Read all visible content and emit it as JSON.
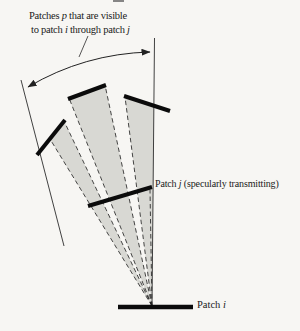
{
  "figure": {
    "title_domain": "radiosity-specular-transmission-diagram",
    "background": "#f7f6f3",
    "ink": "#1a1a1a",
    "shade": "#d8d8d3",
    "caption": {
      "line1": [
        {
          "t": "Patches "
        },
        {
          "t": "p",
          "i": true
        },
        {
          "t": " that are visible"
        }
      ],
      "line2": [
        {
          "t": "to patch "
        },
        {
          "t": "i",
          "i": true
        },
        {
          "t": " through patch "
        },
        {
          "t": "j",
          "i": true
        }
      ]
    },
    "labels": {
      "patch_j": [
        {
          "t": "Patch "
        },
        {
          "t": "j",
          "i": true
        },
        {
          "t": " (specularly transmitting)"
        }
      ],
      "patch_i": [
        {
          "t": "Patch "
        },
        {
          "t": "i",
          "i": true
        }
      ]
    },
    "shapes": [
      {
        "name": "beam-wedge-left",
        "tag": "polygon",
        "attrs": {
          "points": "152,306 50,139 64,121",
          "fill": "#d8d8d3"
        }
      },
      {
        "name": "beam-wedge-middle",
        "tag": "polygon",
        "attrs": {
          "points": "152,306 69,98 105,85",
          "fill": "#d8d8d3"
        }
      },
      {
        "name": "beam-wedge-right",
        "tag": "polygon",
        "attrs": {
          "points": "152,306 125,97 154,105",
          "fill": "#d8d8d3"
        }
      },
      {
        "name": "dashed-ray-1",
        "tag": "line",
        "attrs": {
          "x1": "152",
          "y1": "306",
          "x2": "50",
          "y2": "139",
          "stroke": "#1a1a1a",
          "stroke-width": "0.8",
          "stroke-dasharray": "4.5 3"
        }
      },
      {
        "name": "dashed-ray-2",
        "tag": "line",
        "attrs": {
          "x1": "152",
          "y1": "306",
          "x2": "64",
          "y2": "121",
          "stroke": "#1a1a1a",
          "stroke-width": "0.8",
          "stroke-dasharray": "4.5 3"
        }
      },
      {
        "name": "dashed-ray-3",
        "tag": "line",
        "attrs": {
          "x1": "152",
          "y1": "306",
          "x2": "69",
          "y2": "98",
          "stroke": "#1a1a1a",
          "stroke-width": "0.8",
          "stroke-dasharray": "4.5 3"
        }
      },
      {
        "name": "dashed-ray-4",
        "tag": "line",
        "attrs": {
          "x1": "152",
          "y1": "306",
          "x2": "105",
          "y2": "85",
          "stroke": "#1a1a1a",
          "stroke-width": "0.8",
          "stroke-dasharray": "4.5 3"
        }
      },
      {
        "name": "dashed-ray-5",
        "tag": "line",
        "attrs": {
          "x1": "152",
          "y1": "306",
          "x2": "125",
          "y2": "97",
          "stroke": "#1a1a1a",
          "stroke-width": "0.8",
          "stroke-dasharray": "4.5 3"
        }
      },
      {
        "name": "dashed-ray-6",
        "tag": "line",
        "attrs": {
          "x1": "152",
          "y1": "306",
          "x2": "150",
          "y2": "190",
          "stroke": "#1a1a1a",
          "stroke-width": "0.8",
          "stroke-dasharray": "4.5 3"
        }
      },
      {
        "name": "beam-boundary-right",
        "tag": "line",
        "attrs": {
          "x1": "152",
          "y1": "306",
          "x2": "154.5",
          "y2": "38",
          "stroke": "#2c2c2c",
          "stroke-width": "0.9"
        }
      },
      {
        "name": "beam-boundary-left",
        "tag": "line",
        "attrs": {
          "x1": "21",
          "y1": "80",
          "x2": "64",
          "y2": "246",
          "stroke": "#2c2c2c",
          "stroke-width": "0.9"
        }
      },
      {
        "name": "angle-arc",
        "tag": "path",
        "attrs": {
          "d": "M 28 87 A 253 253 0 0 1 150 52",
          "fill": "none",
          "stroke": "#222222",
          "stroke-width": "1",
          "marker-start": "url(#arrow)",
          "marker-end": "url(#arrow)"
        }
      },
      {
        "name": "caption-leader-line",
        "tag": "line",
        "attrs": {
          "x1": "88",
          "y1": "36",
          "x2": "79",
          "y2": "57",
          "stroke": "#2c2c2c",
          "stroke-width": "0.8"
        }
      },
      {
        "name": "patch-p-left",
        "tag": "line",
        "attrs": {
          "x1": "37",
          "y1": "155",
          "x2": "65",
          "y2": "120",
          "stroke": "#0b0b0b",
          "stroke-width": "4"
        }
      },
      {
        "name": "patch-p-middle",
        "tag": "line",
        "attrs": {
          "x1": "68",
          "y1": "99",
          "x2": "106",
          "y2": "85",
          "stroke": "#0b0b0b",
          "stroke-width": "4"
        }
      },
      {
        "name": "patch-p-right",
        "tag": "line",
        "attrs": {
          "x1": "124",
          "y1": "96",
          "x2": "170",
          "y2": "111",
          "stroke": "#0b0b0b",
          "stroke-width": "4"
        }
      },
      {
        "name": "patch-j-bar",
        "tag": "line",
        "attrs": {
          "x1": "88",
          "y1": "206",
          "x2": "152",
          "y2": "187",
          "stroke": "#0b0b0b",
          "stroke-width": "4"
        }
      },
      {
        "name": "patch-i-bar",
        "tag": "line",
        "attrs": {
          "x1": "118",
          "y1": "307",
          "x2": "193",
          "y2": "307",
          "stroke": "#0b0b0b",
          "stroke-width": "4.5"
        }
      }
    ]
  }
}
